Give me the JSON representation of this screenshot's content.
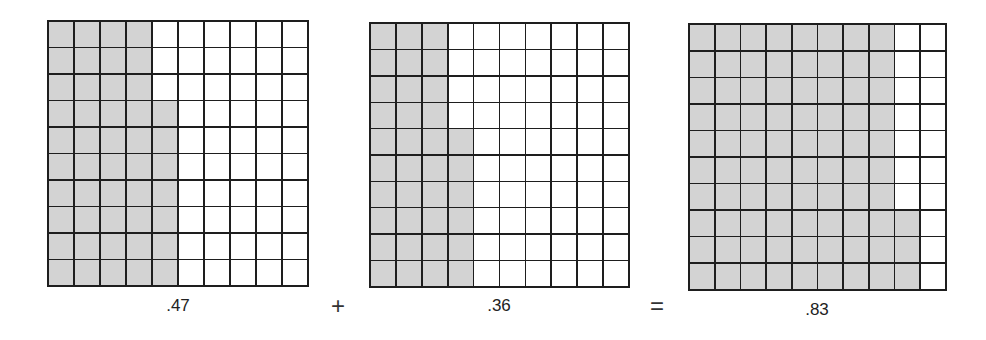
{
  "shade_color": "#d3d3d3",
  "line_color": "#1e1e1e",
  "grids": [
    {
      "label": ".47",
      "full_columns": 4,
      "partial_cells": 7,
      "left": 47,
      "top": 20,
      "width": 262,
      "height": 267,
      "label_x": 178,
      "label_y": 296
    },
    {
      "label": ".36",
      "full_columns": 3,
      "partial_cells": 6,
      "left": 369,
      "top": 22,
      "width": 261,
      "height": 266,
      "label_x": 499,
      "label_y": 296
    },
    {
      "label": ".83",
      "full_columns": 8,
      "partial_cells": 3,
      "left": 688,
      "top": 23,
      "width": 259,
      "height": 268,
      "label_x": 817,
      "label_y": 300
    }
  ],
  "operators": [
    {
      "symbol": "+",
      "x": 338,
      "y": 306
    },
    {
      "symbol": "=",
      "x": 657,
      "y": 306
    }
  ],
  "equation": ".47 + .36 = .83"
}
